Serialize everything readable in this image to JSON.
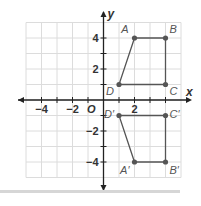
{
  "chart_data": {
    "type": "scatter",
    "title": "",
    "xlabel": "x",
    "ylabel": "y",
    "xlim": [
      -5,
      5
    ],
    "ylim": [
      -5,
      5
    ],
    "grid": true,
    "origin_label": "O",
    "x_ticks": [
      {
        "value": -4,
        "label": "−4"
      },
      {
        "value": -2,
        "label": "−2"
      },
      {
        "value": 2,
        "label": "2"
      }
    ],
    "y_ticks": [
      {
        "value": 4,
        "label": "4"
      },
      {
        "value": 2,
        "label": "2"
      },
      {
        "value": -2,
        "label": "−2"
      },
      {
        "value": -4,
        "label": "−4"
      }
    ],
    "series": [
      {
        "name": "ABCD",
        "points": [
          {
            "label": "A",
            "x": 2,
            "y": 4
          },
          {
            "label": "B",
            "x": 4,
            "y": 4
          },
          {
            "label": "C",
            "x": 4,
            "y": 1
          },
          {
            "label": "D",
            "x": 1,
            "y": 1
          }
        ]
      },
      {
        "name": "A'B'C'D'",
        "points": [
          {
            "label": "A′",
            "x": 2,
            "y": -4
          },
          {
            "label": "B′",
            "x": 4,
            "y": -4
          },
          {
            "label": "C′",
            "x": 4,
            "y": -1
          },
          {
            "label": "D′",
            "x": 1,
            "y": -1
          }
        ]
      }
    ]
  },
  "colors": {
    "grid": "#dcdcdc",
    "axis": "#222222",
    "shape": "#555555",
    "label": "#555555"
  }
}
